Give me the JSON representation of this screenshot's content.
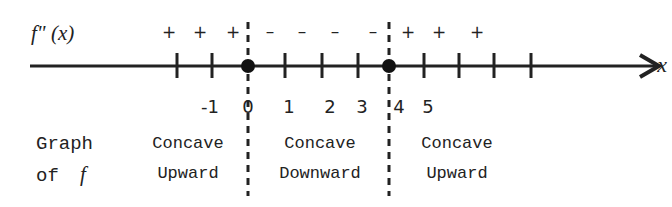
{
  "diagram": {
    "row_label_top": "f\" (x)",
    "axis_variable": "x",
    "tick_labels": [
      "-1",
      "0",
      "1",
      "2",
      "3",
      "4",
      "5"
    ],
    "sign_row": {
      "left": [
        "+",
        "+",
        "+"
      ],
      "middle": [
        "–",
        "–",
        "–",
        "–"
      ],
      "right": [
        "+",
        "+",
        "+"
      ]
    },
    "critical_points": [
      "0",
      "4"
    ],
    "graph_label_line1": "Graph",
    "graph_label_line2_prefix": "of",
    "graph_label_line2_var": "f",
    "intervals": [
      {
        "line1": "Concave",
        "line2": "Upward"
      },
      {
        "line1": "Concave",
        "line2": "Downward"
      },
      {
        "line1": "Concave",
        "line2": "Upward"
      }
    ],
    "colors": {
      "ink": "#222222",
      "background": "#ffffff"
    }
  }
}
